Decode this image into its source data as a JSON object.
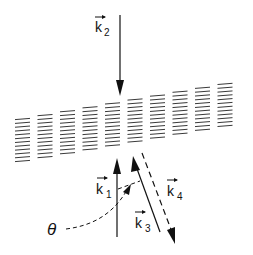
{
  "diagram": {
    "colors": {
      "ink": "#111111",
      "background": "#ffffff"
    },
    "grating": {
      "columns": 10,
      "lines_per_column": 12
    },
    "labels": {
      "k2": {
        "base": "k",
        "sub": "2"
      },
      "k1": {
        "base": "k",
        "sub": "1"
      },
      "k3": {
        "base": "k",
        "sub": "3"
      },
      "k4": {
        "base": "k",
        "sub": "4"
      },
      "theta": "θ"
    },
    "vectors": [
      {
        "name": "k2",
        "style": "solid",
        "direction": "down, incident onto grating from above"
      },
      {
        "name": "k1",
        "style": "solid",
        "direction": "up, toward grating from below"
      },
      {
        "name": "k3",
        "style": "solid",
        "direction": "up-left, toward grating"
      },
      {
        "name": "k4",
        "style": "dashed",
        "direction": "down-right, away from grating"
      }
    ],
    "angle_annotation": {
      "label": "θ",
      "style": "dashed curved arrow",
      "points_to": "angle between k1 and k3"
    }
  }
}
